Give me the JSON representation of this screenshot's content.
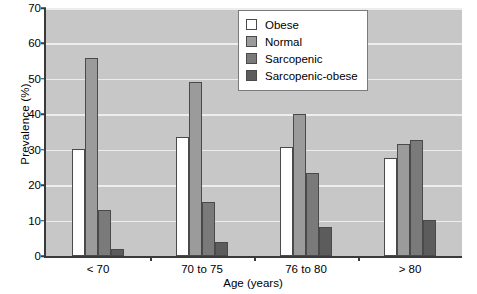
{
  "chart_data": {
    "type": "bar",
    "title": "",
    "xlabel": "Age (years)",
    "ylabel": "Prevalence (%)",
    "categories": [
      "< 70",
      "70 to 75",
      "76 to 80",
      "> 80"
    ],
    "ylim": [
      0,
      70
    ],
    "yticks": [
      0,
      10,
      20,
      30,
      40,
      50,
      60,
      70
    ],
    "grid": true,
    "legend_position": "top-right",
    "series": [
      {
        "name": "Obese",
        "color": "#ffffff",
        "values": [
          30.0,
          33.3,
          30.5,
          27.5
        ]
      },
      {
        "name": "Normal",
        "color": "#9b9b9b",
        "values": [
          55.5,
          48.7,
          39.8,
          31.5
        ]
      },
      {
        "name": "Sarcopenic",
        "color": "#7a7a7a",
        "values": [
          13.0,
          15.0,
          23.3,
          32.5
        ]
      },
      {
        "name": "Sarcopenic-obese",
        "color": "#5c5c5c",
        "values": [
          2.0,
          4.0,
          8.0,
          10.0
        ]
      }
    ]
  },
  "axis": {
    "ylabel": "Prevalence (%)",
    "xlabel": "Age (years)",
    "yticks": [
      "70",
      "60",
      "50",
      "40",
      "30",
      "20",
      "10",
      "0"
    ],
    "xticks": [
      "< 70",
      "70 to 75",
      "76 to 80",
      "> 80"
    ]
  },
  "legend": {
    "items": [
      {
        "label": "Obese"
      },
      {
        "label": "Normal"
      },
      {
        "label": "Sarcopenic"
      },
      {
        "label": "Sarcopenic-obese"
      }
    ]
  },
  "colors": {
    "plot_background": "#c7c7c7",
    "gridline": "#ededed",
    "axis": "#3a3a3a",
    "bar_outline": "#4a4a4a",
    "obese": "#ffffff",
    "normal": "#9b9b9b",
    "sarcopenic": "#7a7a7a",
    "sarcopenic_obese": "#5c5c5c"
  }
}
